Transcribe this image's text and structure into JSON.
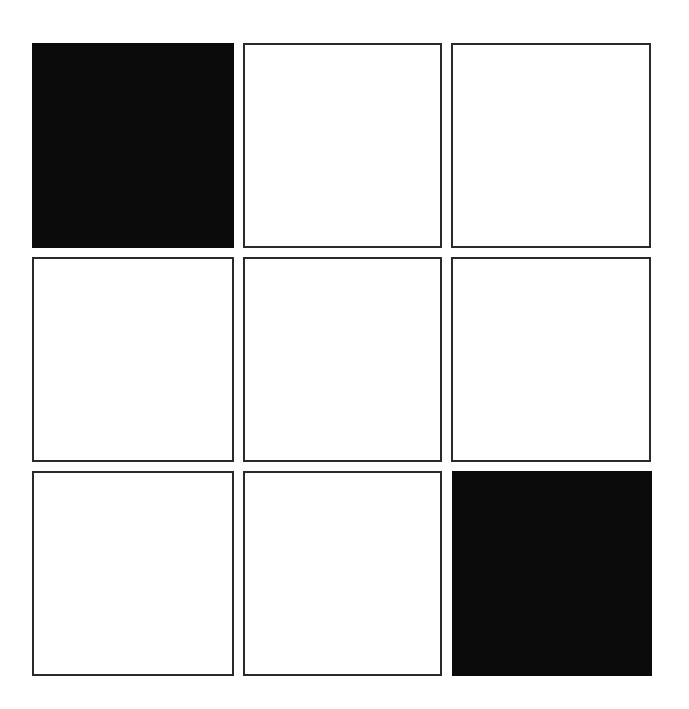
{
  "grid": {
    "rows": 3,
    "cols": 3,
    "cells": [
      {
        "row": 0,
        "col": 0,
        "filled": true
      },
      {
        "row": 0,
        "col": 1,
        "filled": false
      },
      {
        "row": 0,
        "col": 2,
        "filled": false
      },
      {
        "row": 1,
        "col": 0,
        "filled": false
      },
      {
        "row": 1,
        "col": 1,
        "filled": false
      },
      {
        "row": 1,
        "col": 2,
        "filled": false
      },
      {
        "row": 2,
        "col": 0,
        "filled": false
      },
      {
        "row": 2,
        "col": 1,
        "filled": false
      },
      {
        "row": 2,
        "col": 2,
        "filled": true
      }
    ],
    "colors": {
      "filled": "#0a0a0a",
      "empty": "#ffffff",
      "border": "#2a2a2a"
    }
  }
}
